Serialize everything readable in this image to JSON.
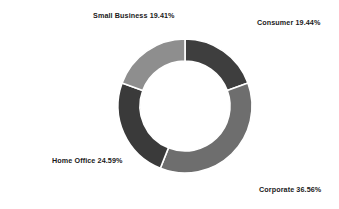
{
  "chart_data": {
    "type": "pie",
    "variant": "donut",
    "title": "",
    "subtitle": "",
    "xlabel": "",
    "ylabel": "",
    "grid": false,
    "legend": "none",
    "label_format": "{name} {percent}%",
    "hole_ratio": 0.67,
    "start_angle_deg": 0,
    "direction": "clockwise",
    "background_color": "#ffffff",
    "categories": [
      "Consumer",
      "Corporate",
      "Home Office",
      "Small Business"
    ],
    "values": [
      19.44,
      36.56,
      24.59,
      19.41
    ],
    "total": 100.0,
    "slices": [
      {
        "name": "Consumer",
        "percent": 19.44,
        "percent_text": "19.44%",
        "label": "Consumer 19.44%",
        "color": "#3e3e3e",
        "start_deg": 0,
        "end_deg": 69.98,
        "label_position": "top-right"
      },
      {
        "name": "Corporate",
        "percent": 36.56,
        "percent_text": "36.56%",
        "label": "Corporate 36.56%",
        "color": "#6e6e6e",
        "start_deg": 69.98,
        "end_deg": 201.6,
        "label_position": "bottom-right"
      },
      {
        "name": "Home Office",
        "percent": 24.59,
        "percent_text": "24.59%",
        "label": "Home Office 24.59%",
        "color": "#3a3a3a",
        "start_deg": 201.6,
        "end_deg": 290.12,
        "label_position": "bottom-left"
      },
      {
        "name": "Small Business",
        "percent": 19.41,
        "percent_text": "19.41%",
        "label": "Small Business 19.41%",
        "color": "#8e8e8e",
        "start_deg": 290.12,
        "end_deg": 360,
        "label_position": "top-left"
      }
    ],
    "geometry": {
      "center_x": 185,
      "center_y": 106,
      "outer_radius": 67,
      "inner_radius": 45
    }
  }
}
